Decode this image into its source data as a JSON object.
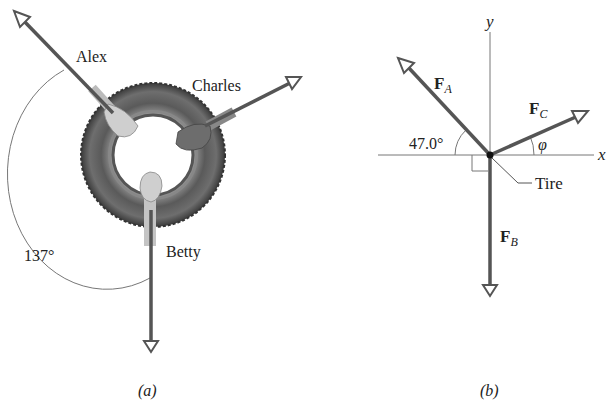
{
  "panel_a": {
    "caption": "(a)",
    "people": [
      {
        "name": "Alex"
      },
      {
        "name": "Charles"
      },
      {
        "name": "Betty"
      }
    ],
    "angle_label": "137°",
    "object": "tire"
  },
  "panel_b": {
    "caption": "(b)",
    "axis_x": "x",
    "axis_y": "y",
    "forces": [
      {
        "symbol": "F",
        "subscript": "A"
      },
      {
        "symbol": "F",
        "subscript": "C"
      },
      {
        "symbol": "F",
        "subscript": "B"
      }
    ],
    "angle_fa": "47.0°",
    "angle_fc": "φ",
    "tire_label": "Tire"
  },
  "colors": {
    "arrow": "#555555",
    "tire_dark": "#3a3a3a",
    "tire_mid": "#7a7a7a",
    "hand_light": "#c8c8c8",
    "hand_dark": "#6a6a6a",
    "line": "#666666"
  }
}
